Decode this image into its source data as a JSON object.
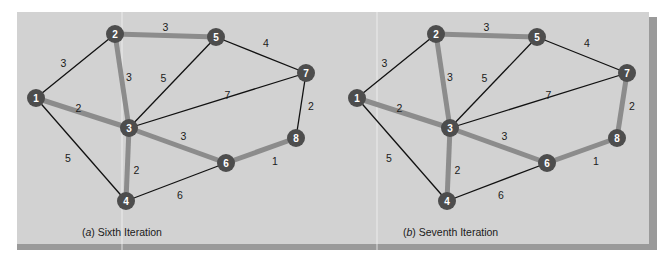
{
  "colors": {
    "background": "#d2d2d2",
    "shadow": "#9a9a9a",
    "node_fill": "#4d4d4d",
    "node_text": "#ffffff",
    "tree_edge": "#8c8c8c",
    "other_edge": "#111111"
  },
  "panels": [
    {
      "id": "a",
      "caption_letter": "a",
      "caption_text": " Sixth Iteration",
      "tree_edges": [
        [
          1,
          3
        ],
        [
          2,
          3
        ],
        [
          2,
          5
        ],
        [
          3,
          4
        ],
        [
          3,
          6
        ],
        [
          6,
          8
        ]
      ],
      "nodes": [
        {
          "id": "1"
        },
        {
          "id": "2"
        },
        {
          "id": "3"
        },
        {
          "id": "4"
        },
        {
          "id": "5"
        },
        {
          "id": "6"
        },
        {
          "id": "7"
        },
        {
          "id": "8"
        }
      ]
    },
    {
      "id": "b",
      "caption_letter": "b",
      "caption_text": " Seventh Iteration",
      "tree_edges": [
        [
          1,
          3
        ],
        [
          2,
          3
        ],
        [
          2,
          5
        ],
        [
          3,
          4
        ],
        [
          3,
          6
        ],
        [
          6,
          8
        ],
        [
          7,
          8
        ]
      ],
      "nodes": [
        {
          "id": "1"
        },
        {
          "id": "2"
        },
        {
          "id": "3"
        },
        {
          "id": "4"
        },
        {
          "id": "5"
        },
        {
          "id": "6"
        },
        {
          "id": "7"
        },
        {
          "id": "8"
        }
      ]
    }
  ],
  "edges": [
    {
      "from": 1,
      "to": 2,
      "weight": "3"
    },
    {
      "from": 1,
      "to": 3,
      "weight": "2"
    },
    {
      "from": 1,
      "to": 4,
      "weight": "5"
    },
    {
      "from": 2,
      "to": 3,
      "weight": "3"
    },
    {
      "from": 2,
      "to": 5,
      "weight": "3"
    },
    {
      "from": 3,
      "to": 5,
      "weight": "5"
    },
    {
      "from": 3,
      "to": 7,
      "weight": "7"
    },
    {
      "from": 3,
      "to": 6,
      "weight": "3"
    },
    {
      "from": 3,
      "to": 4,
      "weight": "2"
    },
    {
      "from": 4,
      "to": 6,
      "weight": "6"
    },
    {
      "from": 5,
      "to": 7,
      "weight": "4"
    },
    {
      "from": 7,
      "to": 8,
      "weight": "2"
    },
    {
      "from": 6,
      "to": 8,
      "weight": "1"
    }
  ]
}
